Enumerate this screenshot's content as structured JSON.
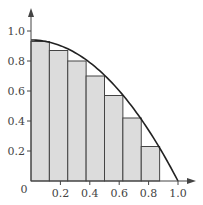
{
  "chart_data": {
    "type": "bar",
    "title": "",
    "subtitle": "",
    "xlabel": "",
    "ylabel": "",
    "xlim": [
      0,
      1.0
    ],
    "ylim": [
      0,
      1.0
    ],
    "grid": false,
    "legend": null,
    "x_ticks": [
      0.2,
      0.4,
      0.6,
      0.8,
      1.0
    ],
    "x_tick_labels": [
      "0.2",
      "0.4",
      "0.6",
      "0.8",
      "1.0"
    ],
    "y_ticks": [
      0.2,
      0.4,
      0.6,
      0.8,
      1.0
    ],
    "y_tick_labels": [
      "0.2",
      "0.4",
      "0.6",
      "0.8",
      "1.0"
    ],
    "origin_label": "0",
    "bars": {
      "x_left": [
        0,
        0.125,
        0.25,
        0.375,
        0.5,
        0.625,
        0.75
      ],
      "width": 0.125,
      "values": [
        0.93,
        0.87,
        0.8,
        0.7,
        0.57,
        0.42,
        0.23
      ]
    },
    "curve": {
      "type": "line",
      "description": "Smooth decreasing curve, approx y = 0.94(1 - x^2)",
      "x": [
        0,
        0.125,
        0.25,
        0.375,
        0.5,
        0.625,
        0.75,
        0.875,
        1.0
      ],
      "y": [
        0.94,
        0.93,
        0.88,
        0.81,
        0.7,
        0.57,
        0.41,
        0.22,
        0.0
      ]
    },
    "colors": {
      "bar_fill": "#dcdcdc",
      "bar_stroke": "#444444",
      "curve": "#222222",
      "axis": "#444444",
      "text": "#444444"
    }
  }
}
